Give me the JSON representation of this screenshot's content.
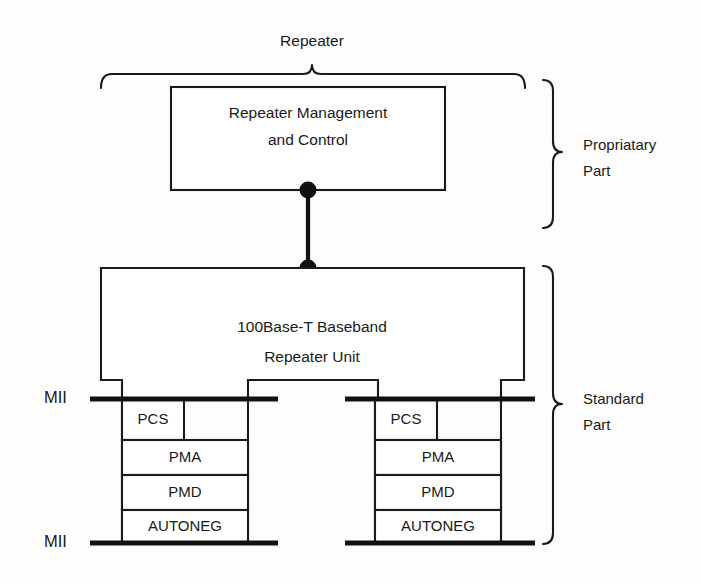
{
  "diagram": {
    "title_top": "Repeater",
    "management_box": {
      "line1": "Repeater Management",
      "line2": "and Control"
    },
    "repeater_unit": {
      "line1": "100Base-T Baseband",
      "line2": "Repeater Unit"
    },
    "side_labels": {
      "proprietary_line1": "Propriatary",
      "proprietary_line2": "Part",
      "standard_line1": "Standard",
      "standard_line2": "Part"
    },
    "interface_labels": {
      "mii_top": "MII",
      "mii_bottom": "MII"
    },
    "stacks": [
      {
        "name": "left-port-stack",
        "layers": [
          {
            "label": "PCS"
          },
          {
            "label": "PMA"
          },
          {
            "label": "PMD"
          },
          {
            "label": "AUTONEG"
          }
        ]
      },
      {
        "name": "right-port-stack",
        "layers": [
          {
            "label": "PCS"
          },
          {
            "label": "PMA"
          },
          {
            "label": "PMD"
          },
          {
            "label": "AUTONEG"
          }
        ]
      }
    ],
    "colors": {
      "line": "#1a1a1a",
      "bold_line": "#111111",
      "background": "#fdfdfd",
      "text": "#1a1a1a"
    }
  }
}
